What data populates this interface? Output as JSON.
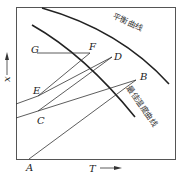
{
  "diagram": {
    "axes": {
      "x_label": "T",
      "y_label": "x"
    },
    "curves": [
      {
        "id": "equilibrium",
        "label": "平衡曲线"
      },
      {
        "id": "optimal-temperature",
        "label": "最佳温度曲线"
      }
    ],
    "points": {
      "A": "A",
      "B": "B",
      "C": "C",
      "D": "D",
      "E": "E",
      "F": "F",
      "G": "G"
    }
  }
}
